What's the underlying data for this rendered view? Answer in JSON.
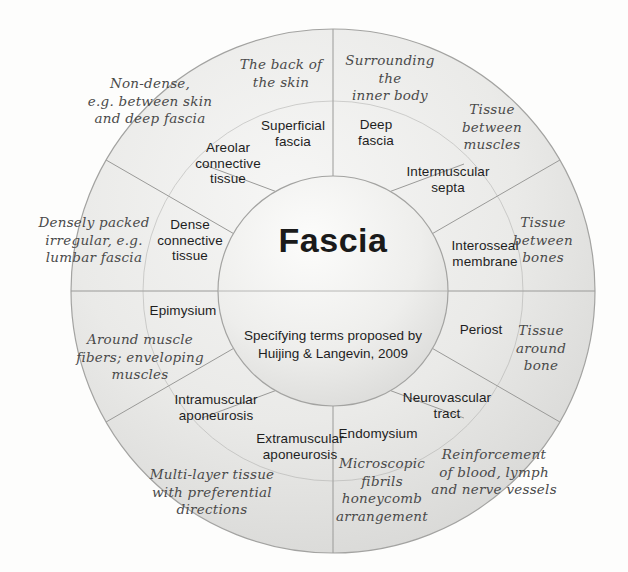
{
  "diagram": {
    "type": "radial-wheel",
    "hub": {
      "title": "Fascia",
      "subtitle": "Specifying terms proposed by\nHuijing & Langevin, 2009"
    },
    "geometry": {
      "center_x": 333,
      "center_y": 291,
      "outer_radius": 262,
      "inner_radius": 115,
      "sector_count": 12,
      "sector_span_degrees": 30,
      "start_angle_degrees": -90
    },
    "colors": {
      "background": "#fdfdfc",
      "ring_fill_light": "#f3f3f2",
      "ring_fill_dark": "#d8d8d6",
      "hub_fill_light": "#fbfbfb",
      "hub_fill_dark": "#dcdcda",
      "stroke": "#9a9a98",
      "term_text": "#1e1e1e",
      "desc_text": "#4a4a4a"
    },
    "sectors": [
      {
        "index": 0,
        "term": "Deep\nfascia",
        "description": "Surrounding\nthe\ninner body",
        "term_x": 376,
        "term_y": 133,
        "desc_x": 390,
        "desc_y": 78
      },
      {
        "index": 1,
        "term": "Intermuscular\nsepta",
        "description": "Tissue\nbetween\nmuscles",
        "term_x": 448,
        "term_y": 180,
        "desc_x": 492,
        "desc_y": 127
      },
      {
        "index": 2,
        "term": "Interosseal\nmembrane",
        "description": "Tissue\nbetween\nbones",
        "term_x": 485,
        "term_y": 254,
        "desc_x": 543,
        "desc_y": 240
      },
      {
        "index": 3,
        "term": "Periost",
        "description": "Tissue\naround\nbone",
        "term_x": 481,
        "term_y": 330,
        "desc_x": 541,
        "desc_y": 348
      },
      {
        "index": 4,
        "term": "Neurovascular\ntract",
        "description": "Reinforcement\nof blood, lymph\nand nerve vessels",
        "term_x": 447,
        "term_y": 406,
        "desc_x": 494,
        "desc_y": 472
      },
      {
        "index": 5,
        "term": "Endomysium",
        "description": "Microscopic\nfibrils\nhoneycomb\narrangement",
        "term_x": 378,
        "term_y": 434,
        "desc_x": 382,
        "desc_y": 490
      },
      {
        "index": 6,
        "term": "Extramuscular\naponeurosis",
        "description": "Multi-layer tissue\nwith preferential\ndirections",
        "term_x": 300,
        "term_y": 447,
        "desc_x": 212,
        "desc_y": 492
      },
      {
        "index": 7,
        "term": "Intramuscular\naponeurosis",
        "description": "",
        "term_x": 216,
        "term_y": 408,
        "desc_x": 0,
        "desc_y": 0
      },
      {
        "index": 8,
        "term": "Epimysium",
        "description": "Around muscle\nfibers; enveloping\nmuscles",
        "term_x": 183,
        "term_y": 311,
        "desc_x": 140,
        "desc_y": 357
      },
      {
        "index": 9,
        "term": "Dense\nconnective\ntissue",
        "description": "Densely packed\nirregular, e.g.\nlumbar fascia",
        "term_x": 190,
        "term_y": 240,
        "desc_x": 94,
        "desc_y": 240
      },
      {
        "index": 10,
        "term": "Areolar\nconnective\ntissue",
        "description": "Non-dense,\ne.g. between skin\nand deep fascia",
        "term_x": 228,
        "term_y": 163,
        "desc_x": 150,
        "desc_y": 101
      },
      {
        "index": 11,
        "term": "Superficial\nfascia",
        "description": "The back of\nthe skin",
        "term_x": 293,
        "term_y": 134,
        "desc_x": 281,
        "desc_y": 74
      }
    ]
  }
}
